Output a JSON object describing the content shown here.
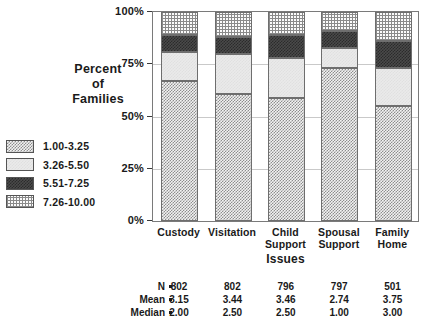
{
  "chart_data": {
    "type": "bar",
    "subtype": "stacked-percentage",
    "title": "",
    "xlabel": "Issues",
    "ylabel": "Percent of Families",
    "ylabel_lines": [
      "Percent",
      "of",
      "Families"
    ],
    "categories": [
      "Custody",
      "Visitation",
      "Child Support",
      "Spousal Support",
      "Family Home"
    ],
    "category_lines": [
      [
        "Custody"
      ],
      [
        "Visitation"
      ],
      [
        "Child",
        "Support"
      ],
      [
        "Spousal",
        "Support"
      ],
      [
        "Family",
        "Home"
      ]
    ],
    "ylim": [
      0,
      100
    ],
    "ytick_labels": [
      "0%",
      "25%",
      "50%",
      "75%",
      "100%"
    ],
    "ytick_values": [
      0,
      25,
      50,
      75,
      100
    ],
    "grid": true,
    "legend_position": "left-outside",
    "series": [
      {
        "name": "1.00-3.25",
        "pattern": "pat-a",
        "values": [
          67,
          61,
          59,
          73,
          55
        ]
      },
      {
        "name": "3.26-5.50",
        "pattern": "pat-b",
        "values": [
          14,
          19,
          19,
          10,
          18
        ]
      },
      {
        "name": "5.51-7.25",
        "pattern": "pat-c",
        "values": [
          8,
          8,
          11,
          8,
          13
        ]
      },
      {
        "name": "7.26-10.00",
        "pattern": "pat-d",
        "values": [
          11,
          12,
          11,
          9,
          14
        ]
      }
    ],
    "cumulative_tops": [
      [
        67,
        81,
        89,
        100
      ],
      [
        61,
        80,
        88,
        100
      ],
      [
        59,
        78,
        89,
        100
      ],
      [
        73,
        83,
        91,
        100
      ],
      [
        55,
        73,
        86,
        100
      ]
    ]
  },
  "legend": {
    "items": [
      {
        "label": "1.00-3.25"
      },
      {
        "label": "3.26-5.50"
      },
      {
        "label": "5.51-7.25"
      },
      {
        "label": "7.26-10.00"
      }
    ]
  },
  "stats_table": {
    "row_labels": [
      "N",
      "Mean",
      "Median"
    ],
    "separator": "=",
    "rows": [
      {
        "label": "N",
        "values": [
          "802",
          "802",
          "796",
          "797",
          "501"
        ]
      },
      {
        "label": "Mean",
        "values": [
          "3.15",
          "3.44",
          "3.46",
          "2.74",
          "3.75"
        ]
      },
      {
        "label": "Median",
        "values": [
          "2.00",
          "2.50",
          "2.50",
          "1.00",
          "3.00"
        ]
      }
    ]
  },
  "colors": {
    "axis": "#3a3a3a",
    "grid": "#c9c9c9",
    "border": "#7a7a7a",
    "text": "#1a1a1a",
    "band_low": "#8d8d8d",
    "band_mid": "#e0e0e0",
    "band_high": "#2b2b2b",
    "band_top": "#8a8a8a"
  }
}
